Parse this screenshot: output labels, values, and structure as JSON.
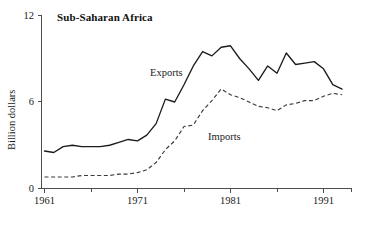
{
  "chart_data": {
    "type": "line",
    "title": "Sub-Saharan Africa",
    "xlabel": "",
    "ylabel": "Billion dollars",
    "grid": false,
    "legend_position": "inline-annotations",
    "xlim": [
      1961,
      1993
    ],
    "ylim": [
      0,
      12
    ],
    "y_ticks": [
      "0",
      "6",
      "12"
    ],
    "y_tick_values": [
      0,
      6,
      12
    ],
    "x_ticks": [
      "1961",
      "1971",
      "1981",
      "1991"
    ],
    "x_tick_values": [
      1961,
      1971,
      1981,
      1991
    ],
    "x_minor_tick_values": [
      1966,
      1976,
      1986,
      1993
    ],
    "x": [
      1961,
      1962,
      1963,
      1964,
      1965,
      1966,
      1967,
      1968,
      1969,
      1970,
      1971,
      1972,
      1973,
      1974,
      1975,
      1976,
      1977,
      1978,
      1979,
      1980,
      1981,
      1982,
      1983,
      1984,
      1985,
      1986,
      1987,
      1988,
      1989,
      1990,
      1991,
      1992,
      1993
    ],
    "series": [
      {
        "name": "Exports",
        "style": "solid",
        "color": "#1c1c1c",
        "values": [
          2.6,
          2.5,
          2.9,
          3.0,
          2.9,
          2.9,
          2.9,
          3.0,
          3.2,
          3.4,
          3.3,
          3.7,
          4.5,
          6.2,
          6.0,
          7.2,
          8.5,
          9.5,
          9.2,
          9.8,
          9.9,
          9.0,
          8.3,
          7.5,
          8.5,
          8.0,
          9.4,
          8.6,
          8.7,
          8.8,
          8.3,
          7.2,
          6.9
        ]
      },
      {
        "name": "Imports",
        "style": "dashed",
        "color": "#3a3a3a",
        "values": [
          0.8,
          0.8,
          0.8,
          0.8,
          0.9,
          0.9,
          0.9,
          0.9,
          1.0,
          1.0,
          1.1,
          1.3,
          1.8,
          2.7,
          3.3,
          4.3,
          4.4,
          5.4,
          6.1,
          6.9,
          6.5,
          6.3,
          6.0,
          5.7,
          5.6,
          5.4,
          5.8,
          5.9,
          6.1,
          6.1,
          6.4,
          6.6,
          6.5
        ]
      }
    ],
    "annotations": [
      {
        "text": "Exports",
        "x_px": 150,
        "y_px": 76
      },
      {
        "text": "Imports",
        "x_px": 208,
        "y_px": 140
      }
    ]
  }
}
